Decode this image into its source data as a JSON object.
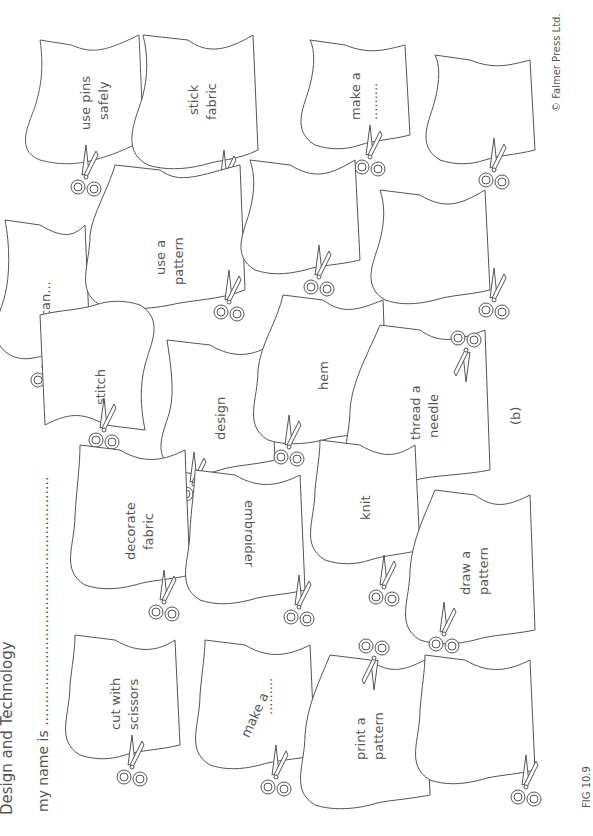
{
  "header": {
    "title": "Design and Technology",
    "name_prompt": "my name is ........................................................"
  },
  "flags": [
    {
      "id": "use-pins",
      "lines": [
        "use pins",
        "safely"
      ]
    },
    {
      "id": "stick-fabric",
      "lines": [
        "stick",
        "fabric"
      ]
    },
    {
      "id": "make-a-top",
      "lines": [
        "make a",
        "........."
      ]
    },
    {
      "id": "blank-top",
      "lines": []
    },
    {
      "id": "i-can",
      "lines": [
        "I can..."
      ]
    },
    {
      "id": "use-a-pattern",
      "lines": [
        "use a",
        "pattern"
      ]
    },
    {
      "id": "blank-mid-1",
      "lines": []
    },
    {
      "id": "blank-mid-2",
      "lines": []
    },
    {
      "id": "stitch",
      "lines": [
        "stitch"
      ]
    },
    {
      "id": "design",
      "lines": [
        "design"
      ]
    },
    {
      "id": "hem",
      "lines": [
        "hem"
      ]
    },
    {
      "id": "thread-a-needle",
      "lines": [
        "thread a",
        "needle"
      ]
    },
    {
      "id": "decorate-fabric",
      "lines": [
        "decorate",
        "fabric"
      ]
    },
    {
      "id": "embroider",
      "lines": [
        "embroider"
      ]
    },
    {
      "id": "knit",
      "lines": [
        "knit"
      ]
    },
    {
      "id": "draw-a-pattern",
      "lines": [
        "draw a",
        "pattern"
      ]
    },
    {
      "id": "cut-with-scissors",
      "lines": [
        "cut with",
        "scissors"
      ]
    },
    {
      "id": "make-a-bottom",
      "lines": [
        "make a",
        "........."
      ]
    },
    {
      "id": "print-a-pattern",
      "lines": [
        "print a",
        "pattern"
      ]
    },
    {
      "id": "blank-bottom",
      "lines": []
    }
  ],
  "labels": {
    "part": "(b)",
    "copyright": "© Falmer Press Ltd.",
    "figure": "FIG 10.9"
  },
  "icons": {
    "scissors": "scissors-icon"
  },
  "colors": {
    "line": "#555555",
    "background": "#ffffff"
  }
}
